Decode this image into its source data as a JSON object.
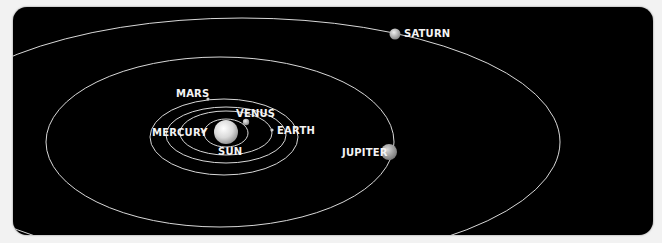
{
  "diagram": {
    "background": "#000000",
    "orbit_color": "#d8d8d8",
    "labels": {
      "sun": "SUN",
      "mercury": "MERCURY",
      "venus": "VENUS",
      "earth": "EARTH",
      "mars": "MARS",
      "jupiter": "JUPITER",
      "saturn": "SATURN"
    }
  }
}
